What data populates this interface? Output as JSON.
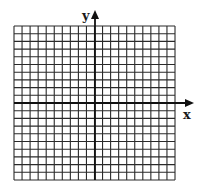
{
  "figure": {
    "type": "coordinate-grid",
    "x_axis_label": "x",
    "y_axis_label": "y",
    "grid_columns": 20,
    "grid_rows": 20,
    "columns_left_of_y_axis": 10,
    "columns_right_of_y_axis": 10,
    "rows_above_x_axis": 10,
    "rows_below_x_axis": 10,
    "colors": {
      "grid_line": "#2a2a2a",
      "axis": "#111111",
      "background": "#ffffff"
    }
  }
}
